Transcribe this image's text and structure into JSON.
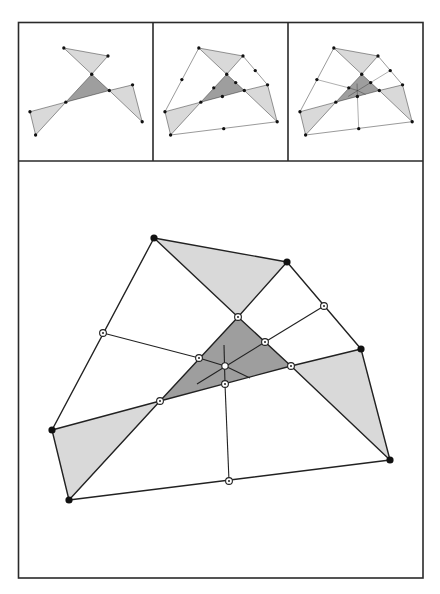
{
  "figure": {
    "colors": {
      "frame": "#2a2a2a",
      "line": "#222222",
      "light_fill": "#d9d9d9",
      "dark_fill": "#9e9e9e",
      "vertex": "#111111"
    },
    "layout": {
      "outer_box": [
        18,
        22,
        423,
        578
      ],
      "top_row_bottom": 161,
      "panel_dividers_x": [
        153,
        288
      ]
    },
    "vertices": {
      "A": [
        154,
        238
      ],
      "B": [
        287,
        262
      ],
      "C": [
        361,
        349
      ],
      "D": [
        390,
        460
      ],
      "E": [
        69,
        500
      ],
      "F": [
        52,
        430
      ]
    },
    "points": {
      "P_top": [
        238,
        317
      ],
      "P_right": [
        291,
        366
      ],
      "P_left": [
        160,
        401
      ],
      "M_AF": [
        103,
        333
      ],
      "M_BC": [
        324,
        306
      ],
      "M_DE": [
        229,
        481
      ],
      "M_PtPr": [
        265,
        342
      ],
      "M_PtPl": [
        199,
        358
      ],
      "M_PlPr": [
        225,
        384
      ],
      "center": [
        225,
        366
      ]
    },
    "panels": [
      {
        "id": "step-1",
        "label": "",
        "shows": "shaded triangles only"
      },
      {
        "id": "step-2",
        "label": "",
        "shows": "hexagon outline with edge midpoints"
      },
      {
        "id": "step-3",
        "label": "",
        "shows": "midpoint connectors through center"
      },
      {
        "id": "final",
        "label": "",
        "shows": "enlarged full construction"
      }
    ]
  }
}
